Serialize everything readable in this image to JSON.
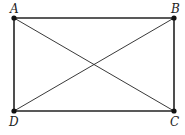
{
  "diagram": {
    "points": [
      {
        "id": "A",
        "label": "A",
        "x": 14,
        "y": 18,
        "lx": 10,
        "ly": 13
      },
      {
        "id": "B",
        "label": "B",
        "x": 174,
        "y": 18,
        "lx": 171,
        "ly": 13
      },
      {
        "id": "C",
        "label": "C",
        "x": 174,
        "y": 111,
        "lx": 170,
        "ly": 126
      },
      {
        "id": "D",
        "label": "D",
        "x": 14,
        "y": 111,
        "lx": 9,
        "ly": 126
      }
    ],
    "edges": [
      {
        "from": "A",
        "to": "B",
        "kind": "side"
      },
      {
        "from": "B",
        "to": "C",
        "kind": "side"
      },
      {
        "from": "C",
        "to": "D",
        "kind": "side"
      },
      {
        "from": "D",
        "to": "A",
        "kind": "side"
      },
      {
        "from": "A",
        "to": "C",
        "kind": "diagonal"
      },
      {
        "from": "B",
        "to": "D",
        "kind": "diagonal"
      }
    ],
    "colors": {
      "stroke": "#222222",
      "point": "#111111",
      "background": "#ffffff"
    }
  }
}
